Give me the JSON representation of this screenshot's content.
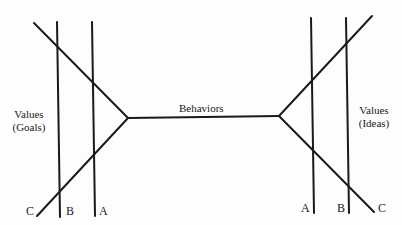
{
  "diagram": {
    "line_color": "#1a1a1a",
    "center_label": "Behaviors",
    "left": {
      "label_line1": "Values",
      "label_line2": "(Goals)",
      "letters": [
        "C",
        "B",
        "A"
      ]
    },
    "right": {
      "label_line1": "Values",
      "label_line2": "(Ideas)",
      "letters": [
        "A",
        "B",
        "C"
      ]
    }
  }
}
